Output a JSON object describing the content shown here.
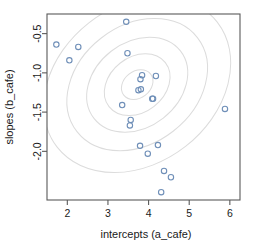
{
  "chart_data": {
    "type": "scatter",
    "title": "",
    "xlabel": "intercepts (a_cafe)",
    "ylabel": "slopes (b_cafe)",
    "xlim": [
      1.5,
      6.25
    ],
    "ylim": [
      -2.62,
      -0.25
    ],
    "xticks": [
      2,
      3,
      4,
      5,
      6
    ],
    "xticklabels": [
      "2",
      "3",
      "4",
      "5",
      "6"
    ],
    "yticks": [
      -0.5,
      -1.0,
      -1.5,
      -2.0
    ],
    "yticklabels": [
      "-0.5",
      "-1.0",
      "-1.5",
      "-2.0"
    ],
    "grid": false,
    "legend": null,
    "point_color": "#6f8fb8",
    "point_fill": "none",
    "point_marker": "open-circle",
    "contour_color": "#dcdcdc",
    "box_color": "#5a5a5a",
    "points": [
      {
        "x": 1.73,
        "y": -0.64
      },
      {
        "x": 2.05,
        "y": -0.84
      },
      {
        "x": 2.27,
        "y": -0.67
      },
      {
        "x": 3.45,
        "y": -0.35
      },
      {
        "x": 3.48,
        "y": -0.75
      },
      {
        "x": 3.8,
        "y": -1.08
      },
      {
        "x": 3.75,
        "y": -1.22
      },
      {
        "x": 3.84,
        "y": -1.03
      },
      {
        "x": 4.18,
        "y": -1.04
      },
      {
        "x": 3.81,
        "y": -1.21
      },
      {
        "x": 4.09,
        "y": -1.33
      },
      {
        "x": 3.35,
        "y": -1.41
      },
      {
        "x": 4.11,
        "y": -1.33
      },
      {
        "x": 3.56,
        "y": -1.6
      },
      {
        "x": 3.54,
        "y": -1.67
      },
      {
        "x": 3.79,
        "y": -1.93
      },
      {
        "x": 4.23,
        "y": -1.92
      },
      {
        "x": 3.98,
        "y": -2.03
      },
      {
        "x": 4.38,
        "y": -2.25
      },
      {
        "x": 4.55,
        "y": -2.33
      },
      {
        "x": 4.31,
        "y": -2.52
      },
      {
        "x": 5.88,
        "y": -1.46
      }
    ],
    "contours": {
      "description": "Nested rotated ellipses of a bivariate normal density, negatively correlated",
      "center": {
        "x": 3.72,
        "y": -1.15
      },
      "rotation_deg": -38,
      "levels": [
        {
          "rx": 0.42,
          "ry": 0.17
        },
        {
          "rx": 0.88,
          "ry": 0.35
        },
        {
          "rx": 1.35,
          "ry": 0.54
        },
        {
          "rx": 1.88,
          "ry": 0.75
        },
        {
          "rx": 2.5,
          "ry": 1.0
        }
      ]
    }
  }
}
